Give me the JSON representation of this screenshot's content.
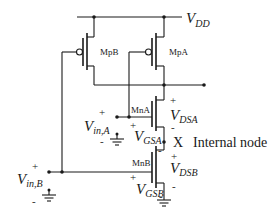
{
  "diagram": {
    "supply": {
      "main": "V",
      "sub": "DD"
    },
    "transistors": [
      {
        "id": "MpB",
        "label": "MpB",
        "type": "PMOS"
      },
      {
        "id": "MpA",
        "label": "MpA",
        "type": "PMOS"
      },
      {
        "id": "MnA",
        "label": "MnA",
        "type": "NMOS"
      },
      {
        "id": "MnB",
        "label": "MnB",
        "type": "NMOS"
      }
    ],
    "inputs": {
      "a": {
        "main": "V",
        "sub": "in,A",
        "plus": "+",
        "minus": "-"
      },
      "b": {
        "main": "V",
        "sub": "in,B",
        "plus": "+",
        "minus": "-"
      }
    },
    "voltages": {
      "vdsa": {
        "main": "V",
        "sub": "DSA",
        "plus": "+",
        "minus": "-"
      },
      "vgsa": {
        "main": "V",
        "sub": "GSA",
        "plus": "+"
      },
      "vdsb": {
        "main": "V",
        "sub": "DSB",
        "plus": "+",
        "minus": "-"
      },
      "vgsb": {
        "main": "V",
        "sub": "GSB",
        "plus": "+",
        "minus": "-"
      },
      "vgsa_minus": "-"
    },
    "internal_node": {
      "name": "X",
      "description": "Internal node"
    }
  }
}
